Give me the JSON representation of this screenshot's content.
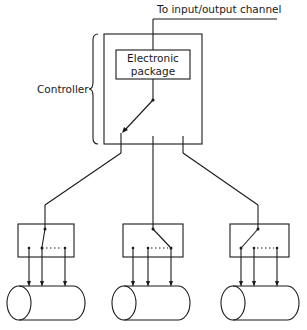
{
  "diagram": {
    "top_label": "To input/output channel",
    "controller_label": "Controller",
    "electronic_package": {
      "line1": "Electronic",
      "line2": "package"
    },
    "devices": [
      {
        "name": "device-left",
        "switch_position": "middle"
      },
      {
        "name": "device-center",
        "switch_position": "right"
      },
      {
        "name": "device-right",
        "switch_position": "left"
      }
    ],
    "colors": {
      "line": "#1a1a1a",
      "background": "#ffffff"
    }
  }
}
